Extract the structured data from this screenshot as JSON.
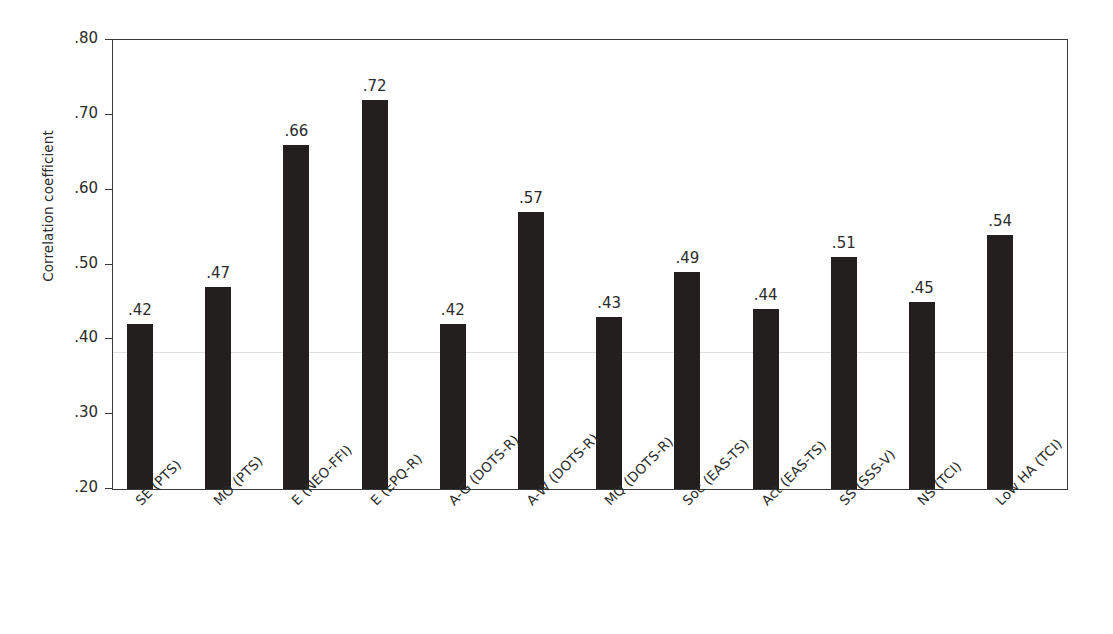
{
  "chart_data": {
    "type": "bar",
    "title": "",
    "xlabel": "",
    "ylabel": "Correlation coefficient",
    "ylim": [
      0.2,
      0.8
    ],
    "yticks": [
      ".20",
      ".30",
      ".40",
      ".50",
      ".60",
      ".70",
      ".80"
    ],
    "ytick_values": [
      0.2,
      0.3,
      0.4,
      0.5,
      0.6,
      0.7,
      0.8
    ],
    "grid": false,
    "legend": null,
    "bar_color": "#231f1f",
    "categories": [
      "SE (PTS)",
      "MO (PTS)",
      "E (NEO-FFI)",
      "E (EPQ-R)",
      "A-G (DOTS-R)",
      "A-W (DOTS-R)",
      "MQ (DOTS-R)",
      "Soc (EAS-TS)",
      "Act (EAS-TS)",
      "SS (SSS-V)",
      "NS (TCI)",
      "Low HA (TCI)"
    ],
    "values": [
      0.42,
      0.47,
      0.66,
      0.72,
      0.42,
      0.57,
      0.43,
      0.49,
      0.44,
      0.51,
      0.45,
      0.54
    ],
    "value_labels": [
      ".42",
      ".47",
      ".66",
      ".72",
      ".42",
      ".57",
      ".43",
      ".49",
      ".44",
      ".51",
      ".45",
      ".54"
    ]
  }
}
